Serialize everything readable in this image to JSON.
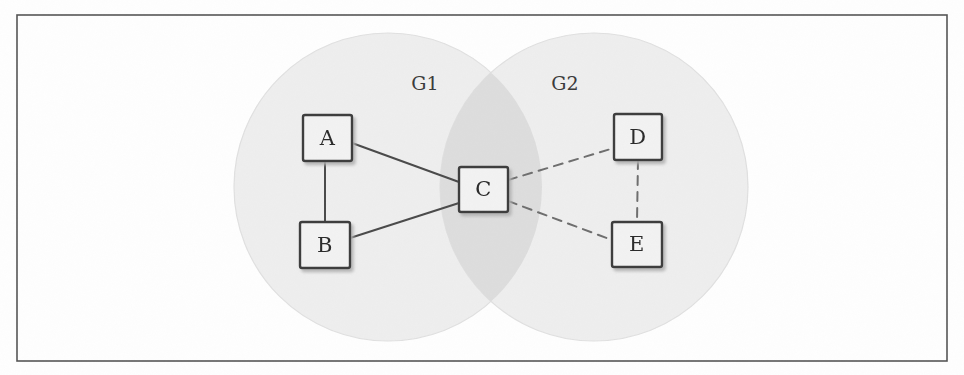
{
  "figure": {
    "background_color": "#fefefe",
    "frame": {
      "name": "outer-border",
      "x": 17,
      "y": 15,
      "width": 930,
      "height": 346,
      "stroke": "#555555",
      "stroke_width": 1.6
    }
  },
  "groups": [
    {
      "id": "G1",
      "label": "G1",
      "label_x": 425,
      "label_y": 85,
      "cx": 388,
      "cy": 187,
      "r": 154,
      "fill": "#eeeeee",
      "stroke": "#e0e0e0"
    },
    {
      "id": "G2",
      "label": "G2",
      "label_x": 565,
      "label_y": 85,
      "cx": 594,
      "cy": 187,
      "r": 154,
      "fill": "#eeeeee",
      "stroke": "#e0e0e0"
    }
  ],
  "overlap": {
    "name": "group-intersection",
    "fill": "#dddddd"
  },
  "nodes": [
    {
      "id": "A",
      "label": "A",
      "x": 303,
      "y": 115,
      "w": 49,
      "h": 46,
      "group": "G1"
    },
    {
      "id": "B",
      "label": "B",
      "x": 300,
      "y": 222,
      "w": 50,
      "h": 46,
      "group": "G1"
    },
    {
      "id": "C",
      "label": "C",
      "x": 459,
      "y": 167,
      "w": 49,
      "h": 45,
      "group": "G1,G2"
    },
    {
      "id": "D",
      "label": "D",
      "x": 614,
      "y": 114,
      "w": 48,
      "h": 46,
      "group": "G2"
    },
    {
      "id": "E",
      "label": "E",
      "x": 612,
      "y": 222,
      "w": 50,
      "h": 45,
      "group": "G2"
    }
  ],
  "node_style": {
    "fill": "#f2f2f2",
    "stroke": "#3d3d3d",
    "stroke_width": 2.4,
    "shadow_color": "#b8b8b8"
  },
  "edges": [
    {
      "id": "A-C",
      "from": "A",
      "to": "C",
      "style": "solid",
      "x1": 352,
      "y1": 143,
      "x2": 459,
      "y2": 182
    },
    {
      "id": "A-B",
      "from": "A",
      "to": "B",
      "style": "solid",
      "x1": 325,
      "y1": 161,
      "x2": 325,
      "y2": 222
    },
    {
      "id": "B-C",
      "from": "B",
      "to": "C",
      "style": "solid",
      "x1": 350,
      "y1": 238,
      "x2": 459,
      "y2": 203
    },
    {
      "id": "C-D",
      "from": "C",
      "to": "D",
      "style": "dashed",
      "x1": 508,
      "y1": 180,
      "x2": 614,
      "y2": 148
    },
    {
      "id": "C-E",
      "from": "C",
      "to": "E",
      "style": "dashed",
      "x1": 508,
      "y1": 201,
      "x2": 612,
      "y2": 240
    },
    {
      "id": "D-E",
      "from": "D",
      "to": "E",
      "style": "dashed",
      "x1": 638,
      "y1": 160,
      "x2": 637,
      "y2": 222
    }
  ],
  "edge_style": {
    "solid_stroke": "#4a4a4a",
    "solid_width": 2.0,
    "dashed_stroke": "#6e6e6e",
    "dashed_width": 2.0,
    "dash_pattern": "9 7"
  }
}
